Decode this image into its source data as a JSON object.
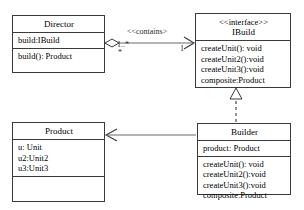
{
  "diagram": {
    "type": "uml-class-diagram",
    "background_color": "#ffffff",
    "line_color": "#3a3a3a"
  },
  "classes": {
    "director": {
      "name": "Director",
      "stereotype": "",
      "attributes": [
        "build:IBuild"
      ],
      "operations": [
        "build(): Product"
      ]
    },
    "ibuild": {
      "name": "IBuild",
      "stereotype": "<<interface>>",
      "attributes": [],
      "operations": [
        "createUnit(): void",
        "createUnit2():void",
        "createUnit3():void",
        "composite:Product"
      ]
    },
    "product": {
      "name": "Product",
      "stereotype": "",
      "attributes": [
        "u: Unit",
        "u2:Unit2",
        "u3:Unit3"
      ],
      "operations": []
    },
    "builder": {
      "name": "Builder",
      "stereotype": "",
      "attributes": [
        "product: Product"
      ],
      "operations": [
        "createUnit(): void",
        "createUnit2():void",
        "createUnit3():void",
        "composite:Product"
      ]
    }
  },
  "relationships": {
    "contains": {
      "label": "<<contains>",
      "source_multiplicity": "1..*",
      "source_multiplicity_second": "*",
      "target_multiplicity": "1",
      "from": "Director",
      "to": "IBuild",
      "kind": "aggregation"
    },
    "realization": {
      "from": "Builder",
      "to": "IBuild",
      "kind": "realization"
    },
    "creates": {
      "from": "Builder",
      "to": "Product",
      "kind": "association"
    }
  }
}
